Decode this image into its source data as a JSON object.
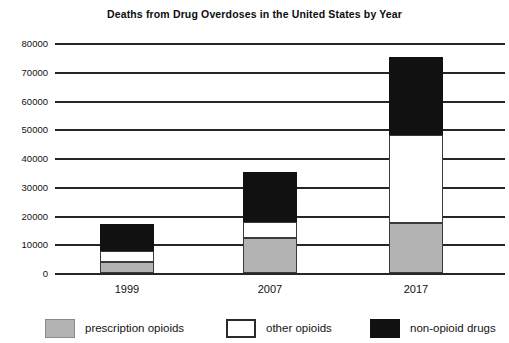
{
  "chart_data": {
    "type": "bar",
    "subtype": "stacked",
    "title": "Deaths from Drug Overdoses in the United States by Year",
    "xlabel": "",
    "ylabel": "",
    "categories": [
      "1999",
      "2007",
      "2017"
    ],
    "ylim": [
      0,
      80000
    ],
    "yticks": [
      0,
      10000,
      20000,
      30000,
      40000,
      50000,
      60000,
      70000,
      80000
    ],
    "ytick_labels": [
      "0",
      "10000",
      "20000",
      "30000",
      "40000",
      "50000",
      "60000",
      "70000",
      "80000"
    ],
    "grid": true,
    "grid_axis": "y",
    "legend_position": "bottom",
    "series": [
      {
        "name": "prescription opioids",
        "color": "#b3b3b3",
        "values": [
          3800,
          12200,
          17400
        ]
      },
      {
        "name": "other opioids",
        "color": "#ffffff",
        "values": [
          3900,
          5600,
          30600
        ]
      },
      {
        "name": "non-opioid drugs",
        "color": "#111111",
        "values": [
          9300,
          17200,
          27000
        ]
      }
    ],
    "totals": [
      17000,
      35000,
      75000
    ]
  },
  "axis": {
    "ytick_0": "0",
    "ytick_1": "10000",
    "ytick_2": "20000",
    "ytick_3": "30000",
    "ytick_4": "40000",
    "ytick_5": "50000",
    "ytick_6": "60000",
    "ytick_7": "70000",
    "ytick_8": "80000",
    "xtick_0": "1999",
    "xtick_1": "2007",
    "xtick_2": "2017"
  },
  "legend": {
    "items": [
      {
        "label": "prescription opioids",
        "swatch": "gray-swatch"
      },
      {
        "label": "other opioids",
        "swatch": "white-swatch"
      },
      {
        "label": "non-opioid drugs",
        "swatch": "black-swatch"
      }
    ]
  }
}
